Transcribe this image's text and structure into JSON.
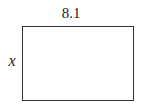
{
  "diagram": {
    "shape": "rectangle",
    "width_label": "8.1",
    "height_label": "x",
    "stroke_color": "#333333"
  }
}
